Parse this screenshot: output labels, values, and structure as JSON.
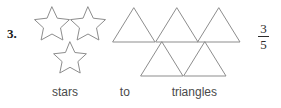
{
  "problem": {
    "number_label": "3.",
    "caption": {
      "left_noun": "stars",
      "connector": "to",
      "right_noun": "triangles"
    },
    "answer": {
      "numerator": "3",
      "denominator": "5",
      "ratio_text": "3/5"
    }
  },
  "shapes": {
    "stars": {
      "icon_name": "star-outline",
      "count": 3,
      "stroke_color": "#8d8d8d",
      "fill_color": "none",
      "positions": [
        {
          "x": 2,
          "y": 2,
          "size": 34
        },
        {
          "x": 38,
          "y": 2,
          "size": 34
        },
        {
          "x": 21,
          "y": 36,
          "size": 32
        }
      ]
    },
    "triangles": {
      "icon_name": "triangle-outline",
      "count": 5,
      "stroke_color": "#8d8d8d",
      "fill_color": "none",
      "rows": [
        {
          "row": 1,
          "count": 3
        },
        {
          "row": 2,
          "count": 2
        }
      ],
      "positions": [
        {
          "x": 0,
          "y": 0,
          "w": 45,
          "h": 36
        },
        {
          "x": 43,
          "y": 0,
          "w": 45,
          "h": 36
        },
        {
          "x": 85,
          "y": 0,
          "w": 45,
          "h": 36
        },
        {
          "x": 28,
          "y": 36,
          "w": 45,
          "h": 36
        },
        {
          "x": 71,
          "y": 36,
          "w": 45,
          "h": 36
        }
      ]
    }
  },
  "colors": {
    "background": "#ffffff",
    "shape_stroke": "#8d8d8d",
    "caption_text": "#4a4a4a",
    "number_text": "#1a1a1a",
    "answer_text": "#2b2b2b"
  }
}
